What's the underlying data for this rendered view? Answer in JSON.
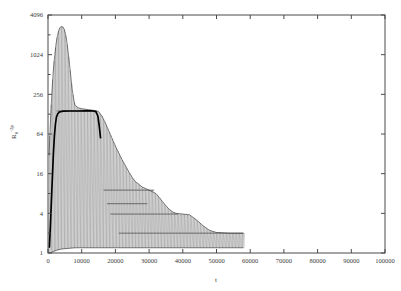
{
  "figure": {
    "background_color": "#ffffff",
    "axis_color": "#4a4a4a",
    "curve_color": "#8a8a8a",
    "envelope_color": "#2b2b2b",
    "highlight_color": "#000000"
  },
  "chart_data": {
    "type": "line",
    "title": "",
    "xlabel": "t",
    "ylabel": "R0^-2p",
    "xlim": [
      0,
      100000
    ],
    "ylim": [
      1,
      4096
    ],
    "yscale": "log",
    "ybase": 4,
    "grid": false,
    "legend": null,
    "xticks": [
      0,
      10000,
      20000,
      30000,
      40000,
      50000,
      60000,
      70000,
      80000,
      90000,
      100000
    ],
    "xticklabels": [
      "0",
      "10000",
      "20000",
      "30000",
      "40000",
      "50000",
      "60000",
      "70000",
      "80000",
      "90000",
      "100000"
    ],
    "yticks": [
      1,
      4,
      16,
      64,
      256,
      1024,
      4096
    ],
    "yticklabels": [
      "1",
      "4",
      "16",
      "64",
      "256",
      "1024",
      "4096"
    ],
    "minor_yticks": [
      2,
      8,
      32,
      128,
      512,
      2048
    ],
    "series": [
      {
        "name": "upper-envelope",
        "points": [
          [
            300,
            30
          ],
          [
            600,
            70
          ],
          [
            900,
            150
          ],
          [
            1200,
            300
          ],
          [
            1600,
            600
          ],
          [
            2000,
            1000
          ],
          [
            2400,
            1500
          ],
          [
            2800,
            2000
          ],
          [
            3200,
            2400
          ],
          [
            3600,
            2650
          ],
          [
            4000,
            2750
          ],
          [
            4400,
            2700
          ],
          [
            4800,
            2500
          ],
          [
            5200,
            2100
          ],
          [
            5600,
            1600
          ],
          [
            6000,
            1100
          ],
          [
            6400,
            720
          ],
          [
            6800,
            460
          ],
          [
            7200,
            300
          ],
          [
            7600,
            220
          ],
          [
            8000,
            175
          ],
          [
            9000,
            160
          ],
          [
            10000,
            155
          ],
          [
            12000,
            150
          ],
          [
            14000,
            145
          ],
          [
            15000,
            140
          ],
          [
            16000,
            120
          ],
          [
            17000,
            95
          ],
          [
            18000,
            72
          ],
          [
            19000,
            55
          ],
          [
            20000,
            42
          ],
          [
            21000,
            33
          ],
          [
            22000,
            26
          ],
          [
            23000,
            21
          ],
          [
            24000,
            17
          ],
          [
            25000,
            14
          ],
          [
            26000,
            12
          ],
          [
            27000,
            11
          ],
          [
            28000,
            10
          ],
          [
            29000,
            9.5
          ],
          [
            30000,
            9
          ],
          [
            31000,
            8.5
          ],
          [
            32000,
            8
          ],
          [
            33000,
            7
          ],
          [
            34000,
            6
          ],
          [
            35000,
            5.2
          ],
          [
            36000,
            4.6
          ],
          [
            37000,
            4.2
          ],
          [
            38000,
            4.0
          ],
          [
            40000,
            3.9
          ],
          [
            42000,
            3.8
          ],
          [
            44000,
            3.2
          ],
          [
            46000,
            2.6
          ],
          [
            48000,
            2.2
          ],
          [
            50000,
            2.05
          ],
          [
            54000,
            2.0
          ],
          [
            58000,
            2.0
          ]
        ]
      },
      {
        "name": "lower-envelope",
        "points": [
          [
            300,
            1.0
          ],
          [
            800,
            1.0
          ],
          [
            1500,
            1.05
          ],
          [
            2500,
            1.1
          ],
          [
            4000,
            1.15
          ],
          [
            8000,
            1.2
          ],
          [
            20000,
            1.2
          ],
          [
            40000,
            1.2
          ],
          [
            58000,
            1.2
          ]
        ]
      },
      {
        "name": "highlighted-trajectory",
        "points": [
          [
            400,
            1.2
          ],
          [
            700,
            2.5
          ],
          [
            1000,
            6
          ],
          [
            1300,
            14
          ],
          [
            1600,
            32
          ],
          [
            1900,
            60
          ],
          [
            2200,
            90
          ],
          [
            2500,
            115
          ],
          [
            2900,
            130
          ],
          [
            3400,
            138
          ],
          [
            4500,
            142
          ],
          [
            6500,
            143
          ],
          [
            9000,
            143
          ],
          [
            11000,
            144
          ],
          [
            12500,
            144
          ],
          [
            13500,
            143
          ],
          [
            14200,
            140
          ],
          [
            14800,
            120
          ],
          [
            15200,
            85
          ],
          [
            15600,
            55
          ]
        ]
      },
      {
        "name": "plateau-step-1",
        "y": 143,
        "x_start": 2600,
        "x_end": 14500
      },
      {
        "name": "plateau-step-2",
        "y": 9.0,
        "x_start": 16500,
        "x_end": 31500
      },
      {
        "name": "plateau-step-3",
        "y": 5.6,
        "x_start": 17500,
        "x_end": 29500
      },
      {
        "name": "plateau-step-4",
        "y": 3.9,
        "x_start": 18500,
        "x_end": 38500
      },
      {
        "name": "plateau-step-5",
        "y": 2.0,
        "x_start": 21000,
        "x_end": 58000
      }
    ]
  }
}
